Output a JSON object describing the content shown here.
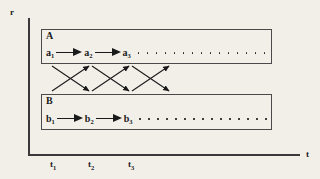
{
  "figure": {
    "background_color": "#f2efe9",
    "ink_color": "#1a1a1a",
    "axes": {
      "vertical_label": "r",
      "horizontal_label": "t"
    },
    "ticks": [
      {
        "label": "t",
        "sub": "1"
      },
      {
        "label": "t",
        "sub": "2"
      },
      {
        "label": "t",
        "sub": "3"
      }
    ],
    "boxes": [
      {
        "title": "A",
        "nodes": [
          {
            "label": "a",
            "sub": "1"
          },
          {
            "label": "a",
            "sub": "2"
          },
          {
            "label": "a",
            "sub": "3"
          }
        ],
        "trailing_dots": 15
      },
      {
        "title": "B",
        "nodes": [
          {
            "label": "b",
            "sub": "1"
          },
          {
            "label": "b",
            "sub": "2"
          },
          {
            "label": "b",
            "sub": "3"
          }
        ],
        "trailing_dots": 15
      }
    ],
    "cross_links": [
      {
        "from": "a1",
        "to": "b2",
        "direction": "down-right"
      },
      {
        "from": "b1",
        "to": "a2",
        "direction": "up-right"
      },
      {
        "from": "a2",
        "to": "b3",
        "direction": "down-right"
      },
      {
        "from": "b2",
        "to": "a3",
        "direction": "up-right"
      },
      {
        "from": "a3",
        "to": "b4",
        "direction": "down-right"
      },
      {
        "from": "b3",
        "to": "a4",
        "direction": "up-right"
      }
    ]
  }
}
